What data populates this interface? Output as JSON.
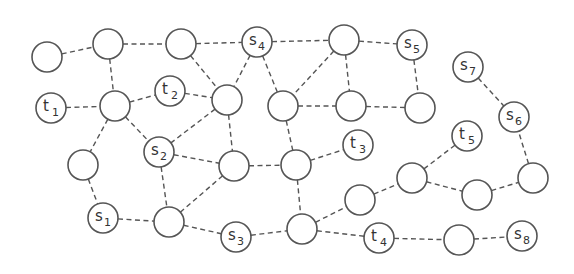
{
  "diagram": {
    "type": "graph",
    "node_radius": 15,
    "edge_style": "dashed",
    "colors": {
      "stroke": "#555555",
      "text": "#333333",
      "fill": "#ffffff",
      "background": "#ffffff"
    },
    "nodes": [
      {
        "id": "A",
        "x": 47,
        "y": 57,
        "letter": "",
        "sub": ""
      },
      {
        "id": "B",
        "x": 108,
        "y": 44,
        "letter": "",
        "sub": ""
      },
      {
        "id": "C",
        "x": 181,
        "y": 44,
        "letter": "",
        "sub": ""
      },
      {
        "id": "s4",
        "x": 257,
        "y": 42,
        "letter": "s",
        "sub": "4"
      },
      {
        "id": "D",
        "x": 344,
        "y": 40,
        "letter": "",
        "sub": ""
      },
      {
        "id": "s5",
        "x": 412,
        "y": 45,
        "letter": "s",
        "sub": "5"
      },
      {
        "id": "s7",
        "x": 468,
        "y": 67,
        "letter": "s",
        "sub": "7"
      },
      {
        "id": "t1",
        "x": 51,
        "y": 108,
        "letter": "t",
        "sub": "1"
      },
      {
        "id": "E",
        "x": 115,
        "y": 106,
        "letter": "",
        "sub": ""
      },
      {
        "id": "t2",
        "x": 170,
        "y": 91,
        "letter": "t",
        "sub": "2"
      },
      {
        "id": "F",
        "x": 227,
        "y": 100,
        "letter": "",
        "sub": ""
      },
      {
        "id": "G",
        "x": 283,
        "y": 106,
        "letter": "",
        "sub": ""
      },
      {
        "id": "H",
        "x": 351,
        "y": 106,
        "letter": "",
        "sub": ""
      },
      {
        "id": "I",
        "x": 420,
        "y": 108,
        "letter": "",
        "sub": ""
      },
      {
        "id": "s6",
        "x": 514,
        "y": 117,
        "letter": "s",
        "sub": "6"
      },
      {
        "id": "s2",
        "x": 159,
        "y": 152,
        "letter": "s",
        "sub": "2"
      },
      {
        "id": "J",
        "x": 83,
        "y": 165,
        "letter": "",
        "sub": ""
      },
      {
        "id": "K",
        "x": 234,
        "y": 166,
        "letter": "",
        "sub": ""
      },
      {
        "id": "L",
        "x": 296,
        "y": 165,
        "letter": "",
        "sub": ""
      },
      {
        "id": "t3",
        "x": 358,
        "y": 145,
        "letter": "t",
        "sub": "3"
      },
      {
        "id": "t5",
        "x": 467,
        "y": 136,
        "letter": "t",
        "sub": "5"
      },
      {
        "id": "M",
        "x": 412,
        "y": 178,
        "letter": "",
        "sub": ""
      },
      {
        "id": "N",
        "x": 533,
        "y": 178,
        "letter": "",
        "sub": ""
      },
      {
        "id": "O",
        "x": 477,
        "y": 195,
        "letter": "",
        "sub": ""
      },
      {
        "id": "P",
        "x": 360,
        "y": 200,
        "letter": "",
        "sub": ""
      },
      {
        "id": "s1",
        "x": 103,
        "y": 218,
        "letter": "s",
        "sub": "1"
      },
      {
        "id": "Q",
        "x": 169,
        "y": 222,
        "letter": "",
        "sub": ""
      },
      {
        "id": "s3",
        "x": 236,
        "y": 237,
        "letter": "s",
        "sub": "3"
      },
      {
        "id": "R",
        "x": 302,
        "y": 229,
        "letter": "",
        "sub": ""
      },
      {
        "id": "t4",
        "x": 379,
        "y": 238,
        "letter": "t",
        "sub": "4"
      },
      {
        "id": "S",
        "x": 459,
        "y": 240,
        "letter": "",
        "sub": ""
      },
      {
        "id": "s8",
        "x": 522,
        "y": 236,
        "letter": "s",
        "sub": "8"
      }
    ],
    "edges": [
      [
        "A",
        "B"
      ],
      [
        "B",
        "C"
      ],
      [
        "C",
        "s4"
      ],
      [
        "s4",
        "D"
      ],
      [
        "D",
        "s5"
      ],
      [
        "B",
        "E"
      ],
      [
        "t1",
        "E"
      ],
      [
        "E",
        "t2"
      ],
      [
        "t2",
        "F"
      ],
      [
        "C",
        "F"
      ],
      [
        "s4",
        "F"
      ],
      [
        "s4",
        "G"
      ],
      [
        "D",
        "G"
      ],
      [
        "D",
        "H"
      ],
      [
        "G",
        "H"
      ],
      [
        "H",
        "I"
      ],
      [
        "s5",
        "I"
      ],
      [
        "E",
        "s2"
      ],
      [
        "E",
        "J"
      ],
      [
        "F",
        "s2"
      ],
      [
        "F",
        "K"
      ],
      [
        "s2",
        "K"
      ],
      [
        "s2",
        "Q"
      ],
      [
        "K",
        "L"
      ],
      [
        "G",
        "L"
      ],
      [
        "L",
        "t3"
      ],
      [
        "L",
        "R"
      ],
      [
        "K",
        "Q"
      ],
      [
        "J",
        "s1"
      ],
      [
        "s1",
        "Q"
      ],
      [
        "Q",
        "s3"
      ],
      [
        "s3",
        "R"
      ],
      [
        "R",
        "P"
      ],
      [
        "R",
        "t4"
      ],
      [
        "P",
        "M"
      ],
      [
        "M",
        "t5"
      ],
      [
        "M",
        "O"
      ],
      [
        "O",
        "N"
      ],
      [
        "N",
        "s6"
      ],
      [
        "s7",
        "s6"
      ],
      [
        "t4",
        "S"
      ],
      [
        "S",
        "s8"
      ]
    ]
  }
}
